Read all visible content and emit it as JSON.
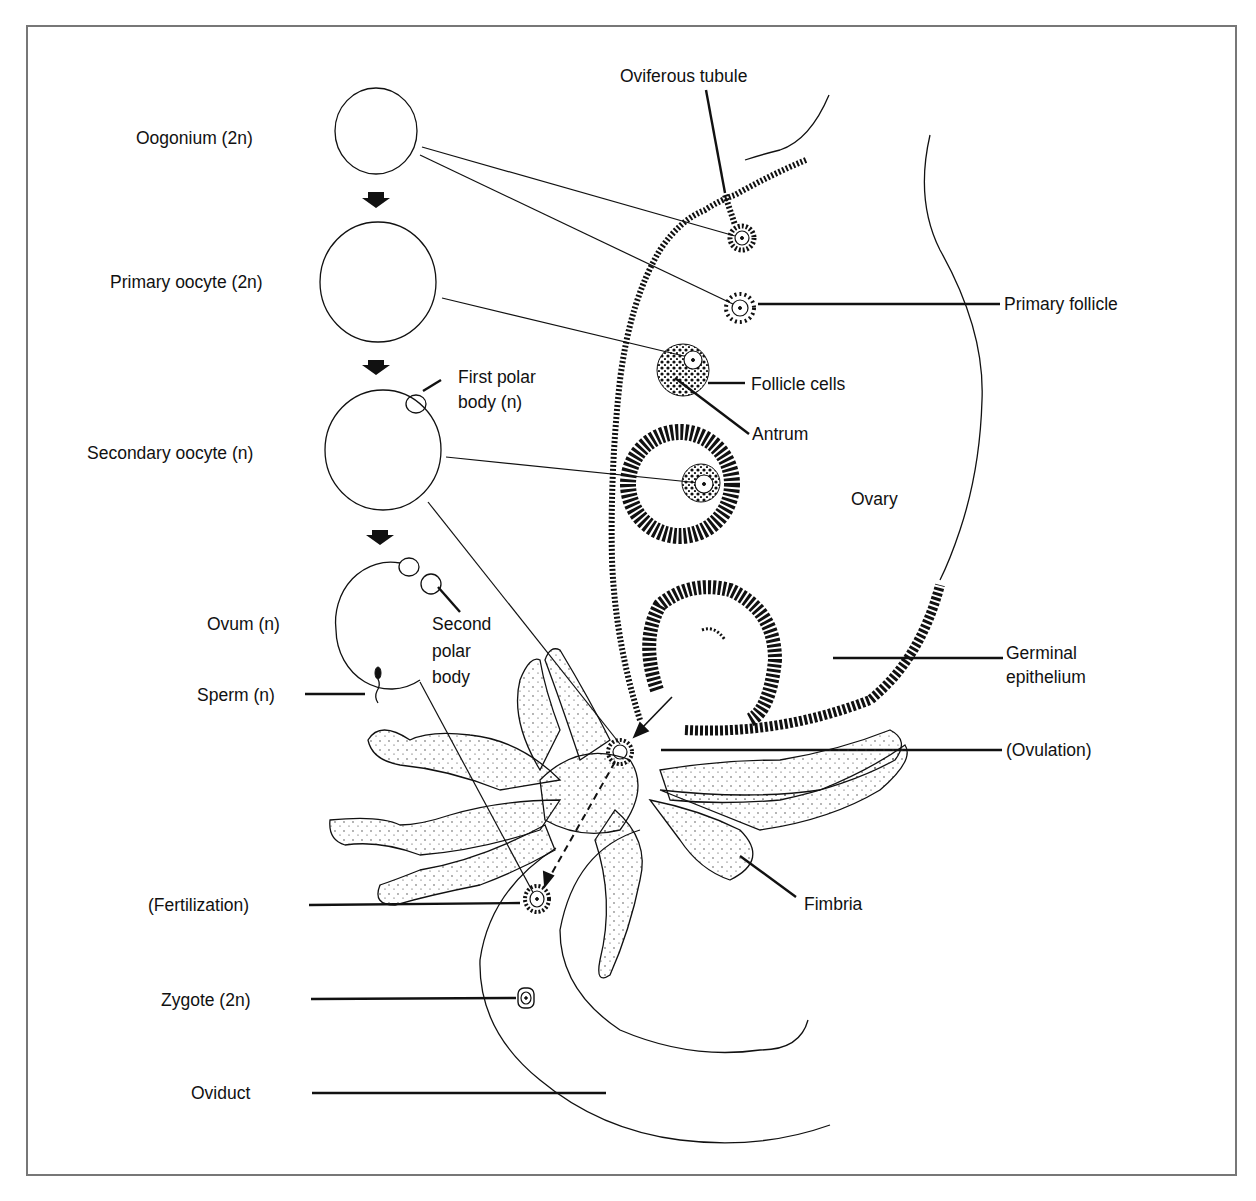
{
  "diagram": {
    "type": "biological-illustration",
    "stages": [
      {
        "label": "Oogonium (2n)"
      },
      {
        "label": "Primary oocyte (2n)"
      },
      {
        "label": "Secondary oocyte (n)"
      },
      {
        "label": "Ovum (n)"
      }
    ],
    "labels": {
      "oogonium": "Oogonium (2n)",
      "primary_oocyte": "Primary oocyte (2n)",
      "first_polar_body_line1": "First polar",
      "first_polar_body_line2": "body (n)",
      "secondary_oocyte": "Secondary oocyte (n)",
      "ovum": "Ovum (n)",
      "second_polar_body_line1": "Second",
      "second_polar_body_line2": "polar",
      "second_polar_body_line3": "body",
      "sperm": "Sperm (n)",
      "fertilization": "(Fertilization)",
      "zygote": "Zygote (2n)",
      "oviduct": "Oviduct",
      "oviferous_tubule": "Oviferous tubule",
      "primary_follicle": "Primary follicle",
      "follicle_cells": "Follicle cells",
      "antrum": "Antrum",
      "ovary": "Ovary",
      "germinal_epithelium_line1": "Germinal",
      "germinal_epithelium_line2": "epithelium",
      "ovulation": "(Ovulation)",
      "fimbria": "Fimbria"
    },
    "colors": {
      "ink": "#111111",
      "frame": "#777777",
      "background": "#ffffff"
    }
  }
}
